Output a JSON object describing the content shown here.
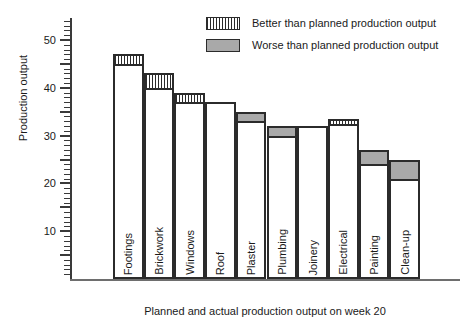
{
  "chart_data": {
    "type": "bar",
    "title": "",
    "subtitle": "",
    "xlabel": "Planned and actual production output on week 20",
    "ylabel": "Production output",
    "ylim": [
      0,
      55
    ],
    "y_major_ticks": [
      10,
      20,
      30,
      40,
      50
    ],
    "y_tick_labels": [
      "10",
      "20",
      "30",
      "40",
      "50"
    ],
    "y_minor_tick_step": 1,
    "y_major_tick_step": 5,
    "grid": false,
    "legend_position": "top-right",
    "legend": [
      {
        "key": "better",
        "label": "Better than planned production output",
        "pattern": "vertical-stripes",
        "color": "#ffffff"
      },
      {
        "key": "worse",
        "label": "Worse than planned production output",
        "pattern": "solid",
        "color": "#a9a9a9"
      }
    ],
    "categories": [
      "Footings",
      "Brickwork",
      "Windows",
      "Roof",
      "Plaster",
      "Plumbing",
      "Joinery",
      "Electrical",
      "Painting",
      "Clean-up"
    ],
    "series": [
      {
        "name": "Planned production output",
        "values": [
          45,
          40,
          37,
          37,
          33,
          30,
          32,
          32.5,
          24,
          21
        ]
      },
      {
        "name": "Actual production output",
        "values": [
          47,
          43,
          39,
          37,
          35,
          32,
          32,
          33.5,
          27,
          25
        ]
      }
    ],
    "variance": [
      {
        "category": "Footings",
        "planned": 45,
        "actual": 47,
        "delta": 2,
        "status": "better"
      },
      {
        "category": "Brickwork",
        "planned": 40,
        "actual": 43,
        "delta": 3,
        "status": "better"
      },
      {
        "category": "Windows",
        "planned": 37,
        "actual": 39,
        "delta": 2,
        "status": "better"
      },
      {
        "category": "Roof",
        "planned": 37,
        "actual": 37,
        "delta": 0,
        "status": "on-target"
      },
      {
        "category": "Plaster",
        "planned": 35,
        "actual": 33,
        "delta": -2,
        "status": "worse"
      },
      {
        "category": "Plumbing",
        "planned": 32,
        "actual": 30,
        "delta": -2,
        "status": "worse"
      },
      {
        "category": "Joinery",
        "planned": 32,
        "actual": 32,
        "delta": 0,
        "status": "on-target"
      },
      {
        "category": "Electrical",
        "planned": 32.5,
        "actual": 33.5,
        "delta": 1,
        "status": "better"
      },
      {
        "category": "Painting",
        "planned": 27,
        "actual": 24,
        "delta": -3,
        "status": "worse"
      },
      {
        "category": "Clean-up",
        "planned": 25,
        "actual": 21,
        "delta": -4,
        "status": "worse"
      }
    ],
    "colors": {
      "axis": "#3a3a3a",
      "bar_outline": "#2b2b2b",
      "bar_fill": "#ffffff",
      "worse_fill": "#a9a9a9",
      "text": "#1a1a1a",
      "background": "#ffffff"
    }
  }
}
